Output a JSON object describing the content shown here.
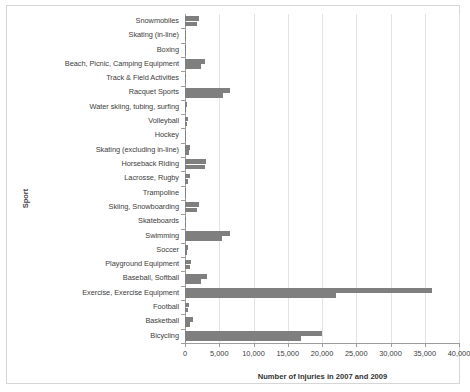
{
  "chart_data": {
    "type": "bar",
    "orientation": "horizontal",
    "title": "",
    "xlabel": "Number of Injuries in 2007 and 2009",
    "ylabel": "Sport",
    "xlim": [
      0,
      40000
    ],
    "xticks": [
      0,
      5000,
      10000,
      15000,
      20000,
      25000,
      30000,
      35000,
      40000
    ],
    "xticklabels": [
      "0",
      "5,000",
      "10,000",
      "15,000",
      "20,000",
      "25,000",
      "30,000",
      "35,000",
      "40,000"
    ],
    "grid": true,
    "legend": null,
    "bar_color": "#7f7f7f",
    "categories": [
      "Snowmobiles",
      "Skating (in-line)",
      "Boxing",
      "Beach, Picnic, Camping Equipment",
      "Track & Field Activities",
      "Racquet Sports",
      "Water skiing, tubing, surfing",
      "Volleyball",
      "Hockey",
      "Skating (excluding in-line)",
      "Horseback Riding",
      "Lacrosse, Rugby",
      "Trampoline",
      "Skiing, Snowboarding",
      "Skateboards",
      "Swimming",
      "Soccer",
      "Playground Equipment",
      "Baseball, Softball",
      "Exercise, Exercise Equipment",
      "Football",
      "Basketball",
      "Bicycling"
    ],
    "series": [
      {
        "name": "2007",
        "values": [
          2000,
          200,
          100,
          2900,
          150,
          6600,
          250,
          500,
          200,
          800,
          3000,
          700,
          150,
          2100,
          200,
          6600,
          500,
          900,
          3200,
          36000,
          600,
          1100,
          20000
        ]
      },
      {
        "name": "2009",
        "values": [
          1800,
          150,
          100,
          2300,
          150,
          5600,
          200,
          350,
          150,
          600,
          2900,
          450,
          120,
          1700,
          150,
          5400,
          350,
          700,
          2300,
          22000,
          400,
          800,
          17000
        ]
      }
    ]
  }
}
